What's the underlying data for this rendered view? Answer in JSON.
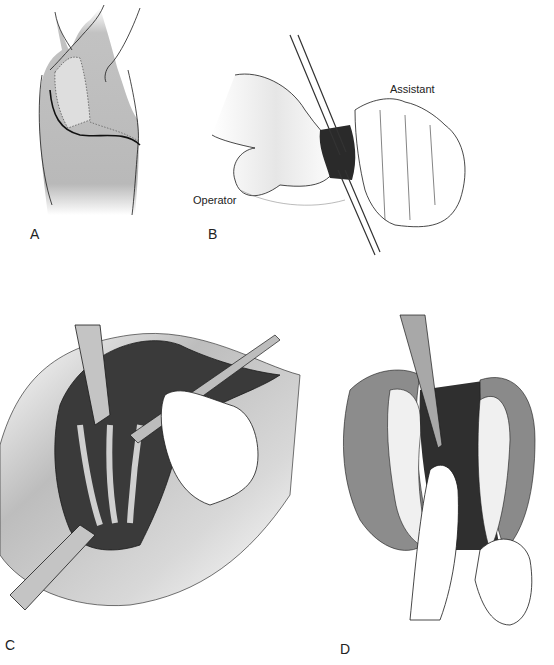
{
  "figure": {
    "panels": [
      {
        "id": "A",
        "label": "A",
        "description": "Lateral view of torso with curved incision line below scapula"
      },
      {
        "id": "B",
        "label": "B",
        "description": "Operator and assistant hands with instruments opening tissue",
        "callouts": [
          "Operator",
          "Assistant"
        ]
      },
      {
        "id": "C",
        "label": "C",
        "description": "Exposed rib cage with retractors and scalpel"
      },
      {
        "id": "D",
        "label": "D",
        "description": "Scalpel incising intercostal tissue while finger protects underlying structure"
      }
    ],
    "colors": {
      "skin_shade": "#b9b9b9",
      "line": "#1a1a1a",
      "dark_tissue": "#2a2a2a",
      "background": "#ffffff"
    }
  }
}
